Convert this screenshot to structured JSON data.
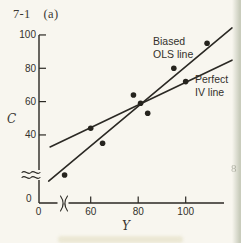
{
  "figure_label": {
    "number": "7-1",
    "part": "(a)"
  },
  "colors": {
    "ink": "#2b2924",
    "paper": "#f8f6ef",
    "page_edge_shadow": "#c9ccbc"
  },
  "chart_data": {
    "type": "scatter",
    "title": "",
    "xlabel": "Y",
    "ylabel": "C",
    "x_ticks": [
      60,
      80,
      100
    ],
    "y_ticks": [
      40,
      60,
      80,
      100
    ],
    "origin_label": "0",
    "x_axis_break": true,
    "y_axis_break": true,
    "xlim_shown": [
      0,
      118
    ],
    "ylim_shown": [
      0,
      100
    ],
    "grid": false,
    "points": [
      [
        49,
        16
      ],
      [
        60,
        44
      ],
      [
        65,
        35
      ],
      [
        78,
        64
      ],
      [
        81,
        59
      ],
      [
        84,
        53
      ],
      [
        95,
        80
      ],
      [
        100,
        72
      ],
      [
        109,
        95
      ]
    ],
    "lines": [
      {
        "name": "biased-ols-line",
        "label_lines": [
          "Biased",
          "OLS line"
        ],
        "slope": 1.19,
        "intercept": -38.0,
        "x_range": [
          42.3,
          119.5
        ]
      },
      {
        "name": "perfect-iv-line",
        "label_lines": [
          "Perfect",
          "IV line"
        ],
        "slope": 0.68,
        "intercept": 3.6,
        "x_range": [
          42.9,
          119.5
        ]
      }
    ]
  },
  "artifacts": {
    "right_edge_mark": "8"
  }
}
